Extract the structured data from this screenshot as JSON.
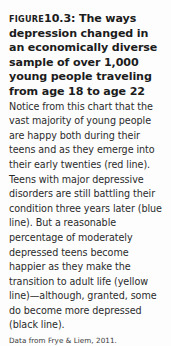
{
  "figure": {
    "label": "FIGURE",
    "number_and_lead": "10.3: The ways depression changed in an economically diverse sample of over 1,000 young people traveling from age 18 to age 22",
    "body": " Notice from this chart that the vast majority of young people are happy both during their teens and as they emerge into their early twenties (red line). Teens with major depressive disorders are still battling their condition three years later (blue line). But a reasonable percentage of moderately depressed teens become happier as they make the transition to adult life (yellow line)—although, granted, some do become more depressed (black line).",
    "source": "Data from Frye & Liem, 2011."
  },
  "colors": {
    "background": "#fdfdfd",
    "heading_text": "#1c1c1c",
    "body_text": "#2b2b2b",
    "source_text": "#3a3a3a"
  }
}
